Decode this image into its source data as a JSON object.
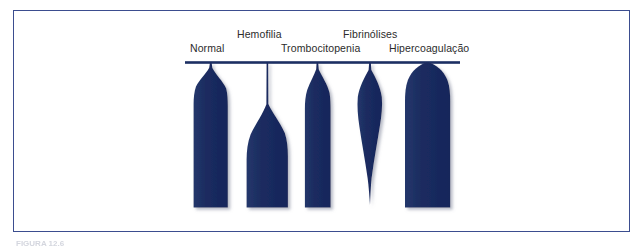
{
  "figure": {
    "caption": "FIGURA 12.6",
    "frame_color": "#3b4d8f",
    "background_color": "#ffffff",
    "trace_color": "#1c2f63",
    "baseline_color": "#1c2f63"
  },
  "diagram": {
    "type": "thromboelastography-tracings",
    "baseline": {
      "x_start": 185,
      "x_end": 460,
      "y": 62
    },
    "labels": {
      "normal": "Normal",
      "hemofilia": "Hemofilia",
      "trombocitopenia": "Trombocitopenia",
      "fibrinolises": "Fibrinólises",
      "hipercoagulacao": "Hipercoagulação"
    },
    "tracings": [
      {
        "name": "normal",
        "label": "Normal",
        "max_amplitude_px": 34,
        "onset_delay_px": 4,
        "bottom_y": 208,
        "shape": "rounded-shoulder-flat-bottom"
      },
      {
        "name": "hemofilia",
        "label": "Hemofilia",
        "max_amplitude_px": 42,
        "onset_delay_px": 46,
        "bottom_y": 208,
        "shape": "long-thin-stem-late-widening"
      },
      {
        "name": "trombocitopenia",
        "label": "Trombocitopenia",
        "max_amplitude_px": 25,
        "onset_delay_px": 6,
        "bottom_y": 208,
        "shape": "narrow-flat-bottom"
      },
      {
        "name": "fibrinolises",
        "label": "Fibrinólises",
        "max_amplitude_px": 24,
        "onset_delay_px": 4,
        "bottom_y": 205,
        "shape": "leaf-tapering-to-point"
      },
      {
        "name": "hipercoagulacao",
        "label": "Hipercoagulação",
        "max_amplitude_px": 46,
        "onset_delay_px": 0,
        "bottom_y": 208,
        "shape": "wide-dome-flat-bottom"
      }
    ]
  }
}
